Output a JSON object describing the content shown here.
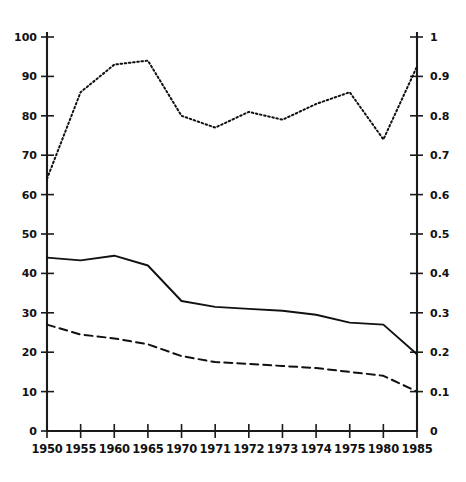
{
  "chart_data": {
    "type": "line",
    "title": "",
    "subtitle": "",
    "xlabel": "",
    "ylabel": "",
    "y2label": "",
    "grid": false,
    "legend": "none",
    "x": [
      1950,
      1955,
      1960,
      1965,
      1970,
      1971,
      1972,
      1973,
      1974,
      1975,
      1980,
      1985
    ],
    "xticklabels": [
      "1950",
      "1955",
      "1960",
      "1965",
      "1970",
      "1971",
      "1972",
      "1973",
      "1974",
      "1975",
      "1980",
      "1985"
    ],
    "ylim": [
      0,
      100
    ],
    "yticks": [
      0,
      10,
      20,
      30,
      40,
      50,
      60,
      70,
      80,
      90,
      100
    ],
    "yticklabels": [
      "0",
      "10",
      "20",
      "30",
      "40",
      "50",
      "60",
      "70",
      "80",
      "90",
      "100"
    ],
    "y2lim": [
      0,
      1
    ],
    "y2ticks": [
      0,
      0.1,
      0.2,
      0.3,
      0.4,
      0.5,
      0.6,
      0.7,
      0.8,
      0.9,
      1
    ],
    "y2ticklabels": [
      "0",
      "0.1",
      "0.2",
      "0.3",
      "0.4",
      "0.5",
      "0.6",
      "0.7",
      "0.8",
      "0.9",
      "1"
    ],
    "series": [
      {
        "name": "dotted-upper-series",
        "style": "dotted",
        "axis": "right",
        "color": "#111111",
        "values": [
          64,
          86,
          93,
          94,
          80,
          77,
          81,
          79,
          83,
          86,
          74,
          92.5
        ]
      },
      {
        "name": "solid-middle-series",
        "style": "solid",
        "axis": "left",
        "color": "#111111",
        "values": [
          44,
          43.3,
          44.5,
          42,
          33,
          31.5,
          31,
          30.5,
          29.5,
          27.5,
          27,
          19.5
        ]
      },
      {
        "name": "dashed-lower-series",
        "style": "dashed",
        "axis": "left",
        "color": "#111111",
        "values": [
          27,
          24.5,
          23.5,
          22,
          19,
          17.5,
          17,
          16.5,
          16,
          15,
          14,
          10
        ]
      }
    ]
  },
  "axes": {
    "left_axis_name": "left-value-axis",
    "right_axis_name": "right-value-axis",
    "bottom_axis_name": "year-axis"
  }
}
